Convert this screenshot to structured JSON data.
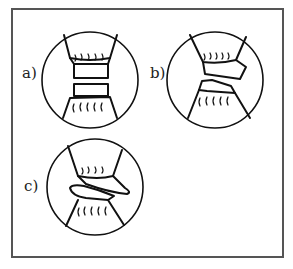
{
  "figure": {
    "panels": [
      {
        "id": "a",
        "label": "a)",
        "description": "Two intact disc segments separated between upper and lower bristled cuffs"
      },
      {
        "id": "b",
        "label": "b)",
        "description": "Disc segments slightly displaced/tilted"
      },
      {
        "id": "c",
        "label": "c)",
        "description": "Disc segments strongly displaced, overlapping and sheared"
      }
    ]
  }
}
